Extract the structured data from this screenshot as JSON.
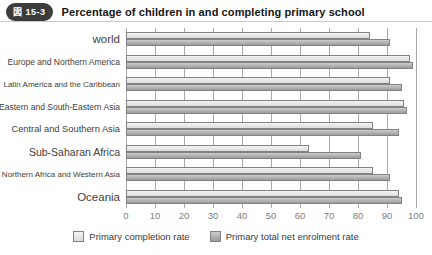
{
  "header": {
    "badge": "図 15-3",
    "title": "Percentage of children in and completing primary school"
  },
  "chart_data": {
    "type": "bar",
    "orientation": "horizontal",
    "title": "Percentage of children in and completing primary school",
    "categories": [
      "world",
      "Europe and Northern America",
      "Latin America and the Caribbean",
      "Eastern and South-Eastern Asia",
      "Central and Southern Asia",
      "Sub-Saharan Africa",
      "Northern Africa and Western Asia",
      "Oceania"
    ],
    "series": [
      {
        "name": "Primary completion rate",
        "color_top": "#f4f4f4",
        "color_bottom": "#dcdcdc",
        "values": [
          84,
          98,
          91,
          96,
          85,
          63,
          85,
          94
        ]
      },
      {
        "name": "Primary total net enrolment rate",
        "color_top": "#cdcdcd",
        "color_bottom": "#9b9b9b",
        "values": [
          91,
          99,
          95,
          97,
          94,
          81,
          91,
          95
        ]
      }
    ],
    "xlabel": "",
    "ylabel": "",
    "xlim": [
      0,
      100
    ],
    "xticks": [
      0,
      10,
      20,
      30,
      40,
      50,
      60,
      70,
      80,
      90,
      100
    ],
    "grid": "vertical",
    "legend_position": "bottom"
  }
}
